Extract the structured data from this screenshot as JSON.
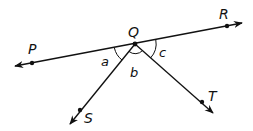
{
  "diagram": {
    "type": "geometry-angles",
    "points": {
      "Q": {
        "label": "Q",
        "x": 135,
        "y": 44
      },
      "P": {
        "label": "P",
        "x": 32,
        "y": 63
      },
      "R": {
        "label": "R",
        "x": 227,
        "y": 26
      },
      "S": {
        "label": "S",
        "x": 80,
        "y": 110
      },
      "T": {
        "label": "T",
        "x": 202,
        "y": 102
      }
    },
    "lines": [
      {
        "name": "line-PR",
        "from": "P",
        "to": "R",
        "arrows": "both"
      }
    ],
    "rays": [
      {
        "name": "ray-QS",
        "from": "Q",
        "through": "S"
      },
      {
        "name": "ray-QT",
        "from": "Q",
        "through": "T"
      }
    ],
    "angles": [
      {
        "label": "a",
        "between": [
          "QP",
          "QS"
        ]
      },
      {
        "label": "b",
        "between": [
          "QS",
          "QT"
        ]
      },
      {
        "label": "c",
        "between": [
          "QT",
          "QR"
        ]
      }
    ],
    "colors": {
      "stroke": "#111111",
      "background": "#ffffff"
    }
  },
  "labels": {
    "Q": "Q",
    "P": "P",
    "R": "R",
    "S": "S",
    "T": "T",
    "a": "a",
    "b": "b",
    "c": "c"
  }
}
